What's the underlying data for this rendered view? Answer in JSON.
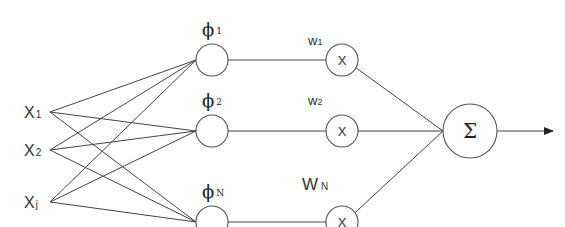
{
  "diagram": {
    "inputs": [
      {
        "name": "X",
        "sub": "1"
      },
      {
        "name": "X",
        "sub": "2"
      },
      {
        "name": "X",
        "sub": "j"
      }
    ],
    "hidden": [
      {
        "name": "ϕ",
        "sub": "1"
      },
      {
        "name": "ϕ",
        "sub": "2"
      },
      {
        "name": "ϕ",
        "sub": "N"
      }
    ],
    "weights": [
      {
        "name": "w",
        "sub": "1",
        "op": "X"
      },
      {
        "name": "w",
        "sub": "2",
        "op": "X"
      },
      {
        "name": "W",
        "sub": "N",
        "op": "X"
      }
    ],
    "output": {
      "symbol": "Σ"
    },
    "colors": {
      "line": "#444444",
      "node": "#555555",
      "text": "#333333"
    }
  }
}
